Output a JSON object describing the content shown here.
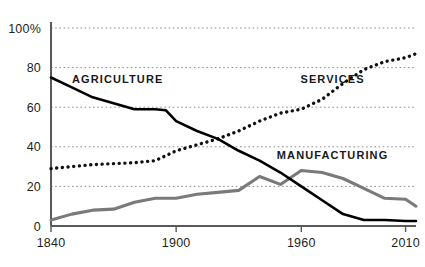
{
  "chart_data": {
    "type": "line",
    "title": "",
    "subtitle": "",
    "xlabel": "",
    "ylabel": "",
    "xlim": [
      1840,
      2015
    ],
    "ylim": [
      0,
      100
    ],
    "grid": true,
    "legend_position": "inline-annotations",
    "x_tick_labels": [
      "1840",
      "1900",
      "1960",
      "2010"
    ],
    "x_ticks": [
      1840,
      1900,
      1960,
      2010
    ],
    "y_tick_labels": [
      "100%",
      "80",
      "60",
      "40",
      "20",
      "0"
    ],
    "y_ticks": [
      100,
      80,
      60,
      40,
      20,
      0
    ],
    "series": [
      {
        "name": "AGRICULTURE",
        "style": "solid",
        "color": "#000000",
        "label_x": 1872,
        "label_y": 72,
        "x": [
          1840,
          1850,
          1860,
          1870,
          1880,
          1890,
          1895,
          1900,
          1910,
          1920,
          1930,
          1940,
          1950,
          1960,
          1970,
          1980,
          1990,
          2000,
          2010,
          2015
        ],
        "y": [
          75,
          70,
          65,
          62,
          59,
          59,
          58.5,
          53,
          48,
          44,
          38,
          33,
          27,
          20,
          13,
          6,
          3,
          3,
          2.5,
          2.5
        ]
      },
      {
        "name": "SERVICES",
        "style": "dotted",
        "color": "#111111",
        "label_x": 1975,
        "label_y": 72,
        "x": [
          1840,
          1850,
          1860,
          1870,
          1880,
          1890,
          1900,
          1910,
          1920,
          1930,
          1940,
          1950,
          1960,
          1970,
          1980,
          1990,
          2000,
          2010,
          2015
        ],
        "y": [
          29,
          30,
          31,
          31.5,
          32,
          33,
          38,
          41,
          44,
          48,
          53,
          57,
          59,
          64,
          72,
          79,
          83,
          85,
          87
        ]
      },
      {
        "name": "MANUFACTURING",
        "style": "solid",
        "color": "#7a7a7a",
        "label_x": 1975,
        "label_y": 34,
        "x": [
          1840,
          1850,
          1860,
          1870,
          1880,
          1890,
          1900,
          1910,
          1920,
          1930,
          1940,
          1950,
          1960,
          1970,
          1980,
          1990,
          2000,
          2010,
          2015
        ],
        "y": [
          3,
          6,
          8,
          8.5,
          12,
          14,
          14,
          16,
          17,
          18,
          25,
          21,
          28,
          27,
          24,
          19,
          14,
          13.5,
          10
        ]
      }
    ]
  }
}
